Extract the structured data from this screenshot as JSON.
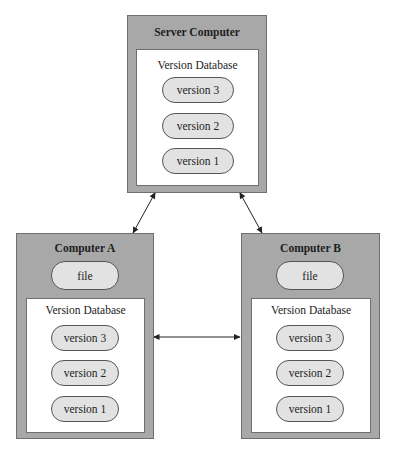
{
  "server": {
    "title": "Server Computer",
    "database": {
      "title": "Version Database",
      "versions": [
        "version 3",
        "version 2",
        "version 1"
      ]
    }
  },
  "computer_a": {
    "title": "Computer A",
    "file": "file",
    "database": {
      "title": "Version Database",
      "versions": [
        "version 3",
        "version 2",
        "version 1"
      ]
    }
  },
  "computer_b": {
    "title": "Computer B",
    "file": "file",
    "database": {
      "title": "Version Database",
      "versions": [
        "version 3",
        "version 2",
        "version 1"
      ]
    }
  },
  "colors": {
    "outer_fill": "#a8a8a8",
    "inner_fill": "#ffffff",
    "pill_fill": "#e2e2e2",
    "stroke": "#555555"
  }
}
